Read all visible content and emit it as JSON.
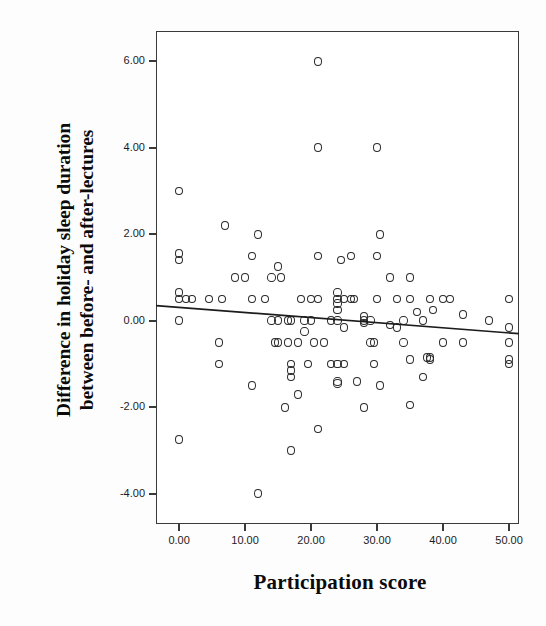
{
  "chart_data": {
    "type": "scatter",
    "title": "",
    "xlabel": "Participation score",
    "ylabel": "Difference in holiday sleep duration between before- and after-lectures",
    "ylabel_line1": "Difference in holiday sleep duration",
    "ylabel_line2": "between before- and after-lectures",
    "xlim": [
      -3.5,
      51.5
    ],
    "ylim": [
      -4.7,
      6.7
    ],
    "xticks": [
      0,
      10,
      20,
      30,
      40,
      50
    ],
    "xticklabels": [
      "0.00",
      "10.00",
      "20.00",
      "30.00",
      "40.00",
      "50.00"
    ],
    "yticks": [
      6,
      4,
      2,
      0,
      -2,
      -4
    ],
    "yticklabels": [
      "6.00",
      "4.00",
      "2.00",
      "0.00",
      "-2.00",
      "-4.00"
    ],
    "grid": false,
    "legend": false,
    "marker": "open-circle",
    "marker_color": "#2b2b2b",
    "fit_line": {
      "type": "linear-regression",
      "x_start": -3.5,
      "y_start": 0.35,
      "x_end": 51.5,
      "y_end": -0.3,
      "color": "#1c1c1c"
    },
    "points": [
      [
        0,
        3.0
      ],
      [
        0,
        -2.75
      ],
      [
        0,
        0.0
      ],
      [
        0,
        0.5
      ],
      [
        0,
        0.65
      ],
      [
        0,
        1.4
      ],
      [
        0,
        1.55
      ],
      [
        1,
        0.5
      ],
      [
        2,
        0.5
      ],
      [
        4.5,
        0.5
      ],
      [
        6,
        -1.0
      ],
      [
        6,
        -0.5
      ],
      [
        6.5,
        0.5
      ],
      [
        7,
        2.2
      ],
      [
        8.5,
        1.0
      ],
      [
        10,
        1.0
      ],
      [
        11,
        1.5
      ],
      [
        11,
        -1.5
      ],
      [
        11,
        0.5
      ],
      [
        12,
        2.0
      ],
      [
        12,
        -4.0
      ],
      [
        13,
        0.5
      ],
      [
        14,
        1.0
      ],
      [
        14,
        0.0
      ],
      [
        14.5,
        -0.5
      ],
      [
        15,
        1.25
      ],
      [
        15,
        -0.5
      ],
      [
        15,
        0.0
      ],
      [
        15.5,
        1.0
      ],
      [
        16,
        -2.0
      ],
      [
        16.5,
        -0.5
      ],
      [
        16.5,
        0.0
      ],
      [
        17,
        -1.0
      ],
      [
        17,
        -1.15
      ],
      [
        17,
        -1.3
      ],
      [
        17,
        -3.0
      ],
      [
        17,
        0.0
      ],
      [
        18,
        -1.7
      ],
      [
        18,
        -0.5
      ],
      [
        18.5,
        0.5
      ],
      [
        19,
        0.0
      ],
      [
        19,
        -0.25
      ],
      [
        19.5,
        -1.0
      ],
      [
        20,
        0.5
      ],
      [
        20,
        0.0
      ],
      [
        20.5,
        -0.5
      ],
      [
        21,
        1.5
      ],
      [
        21,
        6.0
      ],
      [
        21,
        4.0
      ],
      [
        21,
        0.5
      ],
      [
        21,
        -2.5
      ],
      [
        22,
        -0.5
      ],
      [
        23,
        0.0
      ],
      [
        23,
        -1.0
      ],
      [
        24,
        0.5
      ],
      [
        24,
        0.4
      ],
      [
        24,
        0.25
      ],
      [
        24,
        0.65
      ],
      [
        24,
        0.0
      ],
      [
        24,
        -1.4
      ],
      [
        24,
        -1.45
      ],
      [
        24,
        -1.0
      ],
      [
        24.5,
        1.4
      ],
      [
        25,
        0.5
      ],
      [
        25,
        -0.15
      ],
      [
        25,
        -1.0
      ],
      [
        26,
        1.5
      ],
      [
        26,
        0.5
      ],
      [
        26.5,
        0.5
      ],
      [
        27,
        -1.4
      ],
      [
        28,
        0.1
      ],
      [
        28,
        0.0
      ],
      [
        28,
        -0.05
      ],
      [
        28,
        -2.0
      ],
      [
        29,
        0.0
      ],
      [
        29,
        -0.5
      ],
      [
        29.5,
        -0.5
      ],
      [
        29.5,
        -1.0
      ],
      [
        30,
        4.0
      ],
      [
        30,
        1.5
      ],
      [
        30,
        0.5
      ],
      [
        30.5,
        2.0
      ],
      [
        30.5,
        -1.5
      ],
      [
        32,
        1.0
      ],
      [
        32,
        -0.1
      ],
      [
        33,
        0.5
      ],
      [
        33,
        -0.15
      ],
      [
        34,
        0.0
      ],
      [
        34,
        -0.5
      ],
      [
        35,
        1.0
      ],
      [
        35,
        0.5
      ],
      [
        35,
        -0.9
      ],
      [
        35,
        -1.95
      ],
      [
        36,
        0.2
      ],
      [
        37,
        0.0
      ],
      [
        37,
        -1.3
      ],
      [
        37.5,
        -0.85
      ],
      [
        38,
        0.5
      ],
      [
        38,
        -0.85
      ],
      [
        38,
        -0.9
      ],
      [
        38.5,
        0.25
      ],
      [
        40,
        0.5
      ],
      [
        40,
        -0.5
      ],
      [
        41,
        0.5
      ],
      [
        43,
        0.15
      ],
      [
        43,
        -0.5
      ],
      [
        47,
        0.0
      ],
      [
        50,
        0.5
      ],
      [
        50,
        -0.15
      ],
      [
        50,
        -0.5
      ],
      [
        50,
        -0.9
      ],
      [
        50,
        -1.0
      ]
    ]
  }
}
